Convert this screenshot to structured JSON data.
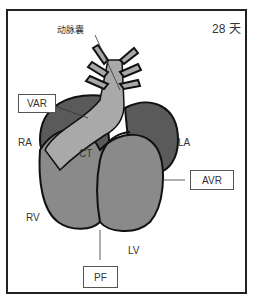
{
  "diagram": {
    "day_label": "28 天",
    "structures": {
      "aortic_sac": "动脉囊",
      "CT": "CT",
      "RA": "RA",
      "LA": "LA",
      "RV": "RV",
      "LV": "LV"
    },
    "boxes": {
      "VAR": "VAR",
      "AVR": "AVR",
      "PF": "PF"
    },
    "colors": {
      "frame": "#222222",
      "atria": "#5a5a5a",
      "ventricles": "#8a8a8a",
      "truncus": "#a9a9a9",
      "outline": "#111111"
    }
  }
}
